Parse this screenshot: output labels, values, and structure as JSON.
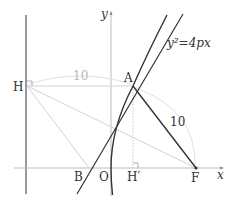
{
  "diagram": {
    "equation_label": "y²=4px",
    "axis_labels": {
      "x": "x",
      "y": "y"
    },
    "points": {
      "H": "H",
      "A": "A",
      "B": "B",
      "O": "O",
      "H_prime": "H′",
      "F": "F"
    },
    "lengths": {
      "HA": "10",
      "AF": "10"
    },
    "colors": {
      "primary_stroke": "#333333",
      "light_stroke": "#cfcfcf",
      "arc_stroke": "#dddddd",
      "gray_label": "#b8b8b8"
    }
  }
}
